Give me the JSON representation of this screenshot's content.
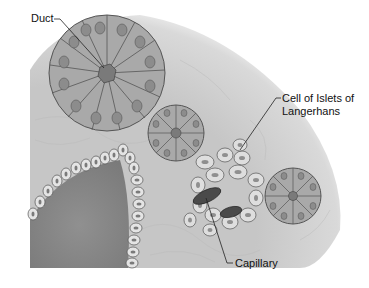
{
  "figure": {
    "labels": {
      "duct": "Duct",
      "islet_line1": "Cell of Islets of",
      "islet_line2": "Langerhans",
      "capillary": "Capillary"
    },
    "colors": {
      "background": "#ffffff",
      "tissue": "#c9c9c9",
      "acinar_cell": "#a9a9a9",
      "acinar_nucleus": "#8c8c8c",
      "acinus_lumen": "#7a7a7a",
      "duct_lumen": "#8a8a8a",
      "duct_cell": "#e4e4e4",
      "islet_cell": "#dedede",
      "islet_nucleus": "#8f8f8f",
      "capillary": "#4a4a4a",
      "outline": "#555555",
      "leader_line": "#222222"
    }
  }
}
